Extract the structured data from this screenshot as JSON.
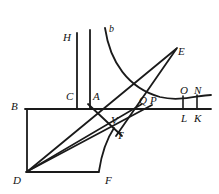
{
  "figure": {
    "background_color": "#ffffff",
    "stroke_color": "#1a1a1a",
    "labels": [
      {
        "id": "H",
        "text": "H",
        "x": 63,
        "y": 32,
        "size": 11
      },
      {
        "id": "b",
        "text": "b",
        "x": 109,
        "y": 24,
        "size": 10
      },
      {
        "id": "E",
        "text": "E",
        "x": 178,
        "y": 46,
        "size": 11
      },
      {
        "id": "C",
        "text": "C",
        "x": 66,
        "y": 91,
        "size": 11
      },
      {
        "id": "A",
        "text": "A",
        "x": 93,
        "y": 91,
        "size": 11
      },
      {
        "id": "Q",
        "text": "Q",
        "x": 139,
        "y": 95,
        "size": 11
      },
      {
        "id": "P",
        "text": "P",
        "x": 150,
        "y": 95,
        "size": 11
      },
      {
        "id": "O",
        "text": "O",
        "x": 180,
        "y": 85,
        "size": 11
      },
      {
        "id": "N",
        "text": "N",
        "x": 194,
        "y": 85,
        "size": 11
      },
      {
        "id": "B",
        "text": "B",
        "x": 11,
        "y": 101,
        "size": 11
      },
      {
        "id": "L",
        "text": "L",
        "x": 181,
        "y": 113,
        "size": 11
      },
      {
        "id": "K",
        "text": "K",
        "x": 194,
        "y": 113,
        "size": 11
      },
      {
        "id": "V",
        "text": "V",
        "x": 111,
        "y": 115,
        "size": 11
      },
      {
        "id": "T",
        "text": "T",
        "x": 117,
        "y": 130,
        "size": 11
      },
      {
        "id": "D",
        "text": "D",
        "x": 13,
        "y": 175,
        "size": 11
      },
      {
        "id": "F",
        "text": "F",
        "x": 105,
        "y": 175,
        "size": 11
      }
    ],
    "segments": [
      {
        "id": "baseline-BN",
        "name": "horizontal-baseline",
        "d": "M 25 109 L 211 109",
        "width": 1.8
      },
      {
        "id": "rect-left-BD",
        "name": "rectangle-left-side",
        "d": "M 27 110 L 27 172",
        "width": 1.8
      },
      {
        "id": "rect-bottom-DF",
        "name": "rectangle-bottom-side",
        "d": "M 26 172 L 99 172",
        "width": 1.8
      },
      {
        "id": "vertical-H",
        "name": "vertical-line-H",
        "d": "M 77 33 L 77 109",
        "width": 1.8
      },
      {
        "id": "vertical-A",
        "name": "vertical-line-A-axis",
        "d": "M 90 30 L 90 109",
        "width": 1.8
      },
      {
        "id": "line-D-E",
        "name": "line-from-D-to-E",
        "d": "M 28 171 L 176 49",
        "width": 1.8
      },
      {
        "id": "line-D-P",
        "name": "line-from-D-to-P",
        "d": "M 28 171 L 152 105",
        "width": 1.8
      },
      {
        "id": "line-D-Q",
        "name": "line-from-D-to-Q",
        "d": "M 28 171 L 142 104",
        "width": 1.5
      },
      {
        "id": "line-A-T-E",
        "name": "line-from-A-through-T",
        "d": "M 88 104 L 122 136",
        "width": 1.8
      },
      {
        "id": "line-T-up-E",
        "name": "line-from-T-up-to-E",
        "d": "M 116 136 L 177 48",
        "width": 1.8
      },
      {
        "id": "tick-O-L",
        "name": "vertical-tick-O-L",
        "d": "M 183 96 L 183 109",
        "width": 1.6
      },
      {
        "id": "tick-N-K",
        "name": "vertical-tick-N-K",
        "d": "M 197 95 L 197 109",
        "width": 1.6
      }
    ],
    "curves": [
      {
        "id": "curve-b",
        "name": "hyperbola-curve-b",
        "d": "M 105 28 C 110 62, 128 88, 160 97 C 180 102, 198 95, 211 95",
        "width": 1.8
      },
      {
        "id": "curve-F-V",
        "name": "curve-from-F-up-to-V",
        "d": "M 99 171 C 101 158, 104 143, 114 128",
        "width": 1.8
      }
    ]
  }
}
